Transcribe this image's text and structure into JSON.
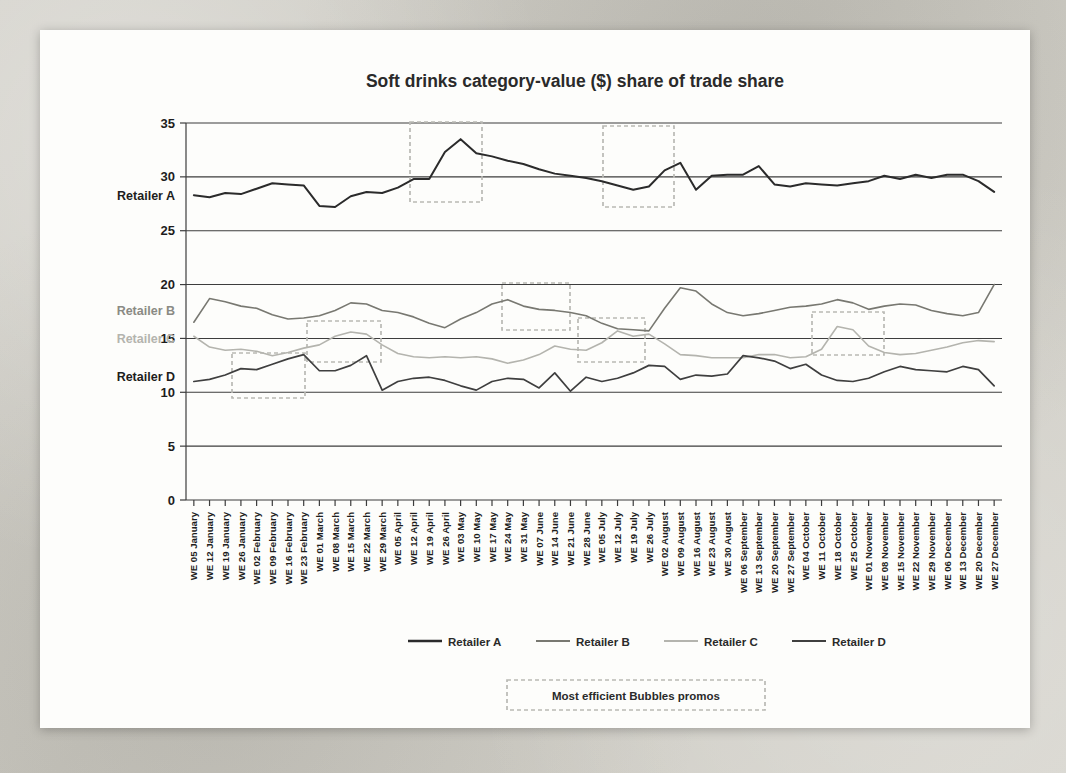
{
  "chart_data": {
    "type": "line",
    "title": "Soft drinks category-value ($) share of trade share",
    "xlabel": "",
    "ylabel": "",
    "ylim": [
      0,
      35
    ],
    "yticks": [
      0,
      5,
      10,
      15,
      20,
      25,
      30,
      35
    ],
    "grid": true,
    "legend_position": "bottom",
    "categories": [
      "WE 05 January",
      "WE 12 January",
      "WE 19 January",
      "WE 26 January",
      "WE 02 February",
      "WE 09 February",
      "WE 16 February",
      "WE 23 February",
      "WE 01 March",
      "WE 08 March",
      "WE 15 March",
      "WE 22 March",
      "WE 29 March",
      "WE 05 April",
      "WE 12 April",
      "WE 19 April",
      "WE 26 April",
      "WE 03 May",
      "WE 10 May",
      "WE 17 May",
      "WE 24 May",
      "WE 31 May",
      "WE 07 June",
      "WE 14 June",
      "WE 21 June",
      "WE 28 June",
      "WE 05 July",
      "WE 12 July",
      "WE 19 July",
      "WE 26 July",
      "WE 02 August",
      "WE 09 August",
      "WE 16 August",
      "WE 23 August",
      "WE 30 August",
      "WE 06 September",
      "WE 13 September",
      "WE 20 September",
      "WE 27 September",
      "WE 04 October",
      "WE 11 October",
      "WE 18 October",
      "WE 25 October",
      "WE 01 November",
      "WE 08 November",
      "WE 15 November",
      "WE 22 November",
      "WE 29 November",
      "WE 06 December",
      "WE 13 December",
      "WE 20 December",
      "WE 27 December"
    ],
    "series": [
      {
        "name": "Retailer A",
        "color": "#2b2b2b",
        "width": 2.0,
        "values": [
          28.3,
          28.1,
          28.5,
          28.4,
          28.9,
          29.4,
          29.3,
          29.2,
          27.3,
          27.2,
          28.2,
          28.6,
          28.5,
          29.0,
          29.8,
          29.8,
          32.3,
          33.5,
          32.2,
          31.9,
          31.5,
          31.2,
          30.7,
          30.3,
          30.1,
          29.9,
          29.6,
          29.2,
          28.8,
          29.1,
          30.6,
          31.3,
          28.8,
          30.1,
          30.2,
          30.2,
          31.0,
          29.3,
          29.1,
          29.4,
          29.3,
          29.2,
          29.4,
          29.6,
          30.1,
          29.8,
          30.2,
          29.9,
          30.2,
          30.2,
          29.6,
          28.6
        ]
      },
      {
        "name": "Retailer B",
        "color": "#787871",
        "width": 1.6,
        "values": [
          16.5,
          18.7,
          18.4,
          18.0,
          17.8,
          17.2,
          16.8,
          16.9,
          17.1,
          17.6,
          18.3,
          18.2,
          17.6,
          17.4,
          17.0,
          16.4,
          16.0,
          16.8,
          17.4,
          18.2,
          18.6,
          18.0,
          17.7,
          17.6,
          17.4,
          17.1,
          16.4,
          15.9,
          15.8,
          15.7,
          17.8,
          19.7,
          19.4,
          18.2,
          17.4,
          17.1,
          17.3,
          17.6,
          17.9,
          18.0,
          18.2,
          18.6,
          18.3,
          17.7,
          18.0,
          18.2,
          18.1,
          17.6,
          17.3,
          17.1,
          17.4,
          20.0
        ]
      },
      {
        "name": "Retailer C",
        "color": "#b4b4ae",
        "width": 1.6,
        "values": [
          15.2,
          14.2,
          13.9,
          14.0,
          13.8,
          13.4,
          13.7,
          14.1,
          14.4,
          15.2,
          15.6,
          15.4,
          14.4,
          13.6,
          13.3,
          13.2,
          13.3,
          13.2,
          13.3,
          13.1,
          12.7,
          13.0,
          13.5,
          14.3,
          14.0,
          13.9,
          14.6,
          15.7,
          15.2,
          15.4,
          14.5,
          13.5,
          13.4,
          13.2,
          13.2,
          13.2,
          13.5,
          13.5,
          13.2,
          13.3,
          14.0,
          16.1,
          15.8,
          14.3,
          13.7,
          13.5,
          13.6,
          13.9,
          14.2,
          14.6,
          14.8,
          14.7
        ]
      },
      {
        "name": "Retailer D",
        "color": "#3f3f3f",
        "width": 1.7,
        "values": [
          11.0,
          11.2,
          11.6,
          12.2,
          12.1,
          12.6,
          13.1,
          13.5,
          12.0,
          12.0,
          12.5,
          13.4,
          10.2,
          11.0,
          11.3,
          11.4,
          11.1,
          10.6,
          10.2,
          11.0,
          11.3,
          11.2,
          10.4,
          11.8,
          10.1,
          11.4,
          11.0,
          11.3,
          11.8,
          12.5,
          12.4,
          11.2,
          11.6,
          11.5,
          11.7,
          13.4,
          13.2,
          12.9,
          12.2,
          12.6,
          11.6,
          11.1,
          11.0,
          11.3,
          11.9,
          12.4,
          12.1,
          12.0,
          11.9,
          12.4,
          12.1,
          10.6
        ]
      }
    ],
    "series_labels_left": [
      {
        "text": "Retailer A",
        "value": 28.3,
        "color": "#1d1d1d"
      },
      {
        "text": "Retailer B",
        "value": 17.6,
        "color": "#8a8a84"
      },
      {
        "text": "Retailer C",
        "value": 15.0,
        "color": "#b4b4ae"
      },
      {
        "text": "Retailer D",
        "value": 11.5,
        "color": "#1d1d1d"
      }
    ],
    "highlight_boxes": [
      {
        "x": 410,
        "y": 122,
        "w": 72,
        "h": 80
      },
      {
        "x": 603,
        "y": 126,
        "w": 71,
        "h": 81
      },
      {
        "x": 232,
        "y": 353,
        "w": 73,
        "h": 45
      },
      {
        "x": 307,
        "y": 321,
        "w": 74,
        "h": 41
      },
      {
        "x": 502,
        "y": 283,
        "w": 68,
        "h": 47
      },
      {
        "x": 578,
        "y": 318,
        "w": 67,
        "h": 44
      },
      {
        "x": 812,
        "y": 312,
        "w": 72,
        "h": 43
      }
    ],
    "annotation": {
      "text": "Most efficient Bubbles promos"
    }
  }
}
